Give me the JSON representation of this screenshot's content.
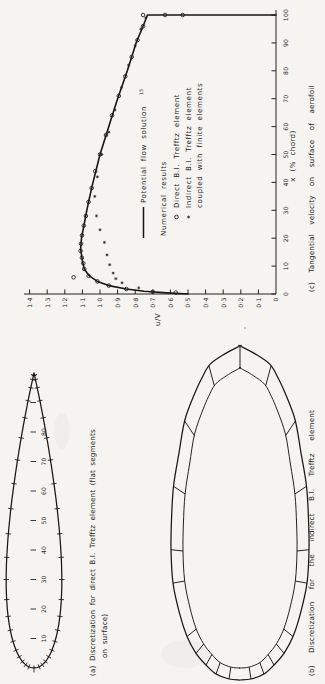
{
  "figure": {
    "background": "#f5f4f0",
    "ink": "#222222",
    "orientation": "rotated-90-ccw"
  },
  "panel_a": {
    "caption_line1": "(a) Discretization for direct B.I. Trefftz element (flat segments",
    "caption_line2": "on surface)",
    "scale_labels": [
      "10",
      "20",
      "30",
      "40",
      "50",
      "60",
      "70",
      "80"
    ]
  },
  "panel_b": {
    "caption": "(b) Discretization for the indirect B.I. Trefftz element"
  },
  "panel_c": {
    "caption": "(c) Tangential velocity on surface of aerofoil",
    "legend": {
      "line_label": "Potential flow solution",
      "line_label_ref": "15",
      "group_label": "Numerical results",
      "circle_label": "Direct B.I. Trefftz element",
      "star_label_line1": "Indirect B.I. Trefftz element",
      "star_label_line2": "coupled with finite elements"
    }
  },
  "chart_data": {
    "type": "line",
    "title": "(c) Tangential velocity on surface of aerofoil",
    "xlabel": "x (% chord)",
    "ylabel": "u/V",
    "xlim": [
      0,
      100
    ],
    "ylim": [
      0,
      1.4
    ],
    "grid": false,
    "legend_position": "inside-below-curve",
    "x_tick_values": [
      0,
      10,
      20,
      30,
      40,
      50,
      60,
      70,
      80,
      90,
      100
    ],
    "x_tick_labels": [
      "0",
      "10",
      "20",
      "30",
      "40",
      "50",
      "60",
      "70",
      "80",
      "90",
      "100"
    ],
    "y_tick_values": [
      0,
      0.1,
      0.2,
      0.3,
      0.4,
      0.5,
      0.6,
      0.7,
      0.8,
      0.9,
      1.0,
      1.1,
      1.2,
      1.3,
      1.4
    ],
    "y_tick_labels": [
      "0",
      "0·1",
      "0·2",
      "0·3",
      "0·4",
      "0·5",
      "0·6",
      "0·7",
      "0·8",
      "0·9",
      "1·0",
      "1·1",
      "1·2",
      "1·3",
      "1·4"
    ],
    "series": [
      {
        "name": "Potential flow solution",
        "type": "line",
        "points": [
          [
            0,
            0.5
          ],
          [
            0.4,
            0.62
          ],
          [
            1,
            0.75
          ],
          [
            1.8,
            0.85
          ],
          [
            3,
            0.95
          ],
          [
            4.5,
            1.015
          ],
          [
            6.5,
            1.06
          ],
          [
            9,
            1.09
          ],
          [
            12,
            1.1
          ],
          [
            16,
            1.11
          ],
          [
            20,
            1.105
          ],
          [
            25,
            1.09
          ],
          [
            30,
            1.075
          ],
          [
            35,
            1.058
          ],
          [
            40,
            1.04
          ],
          [
            45,
            1.02
          ],
          [
            50,
            1.0
          ],
          [
            55,
            0.975
          ],
          [
            60,
            0.95
          ],
          [
            65,
            0.925
          ],
          [
            70,
            0.9
          ],
          [
            75,
            0.872
          ],
          [
            80,
            0.845
          ],
          [
            85,
            0.82
          ],
          [
            90,
            0.795
          ],
          [
            95,
            0.762
          ],
          [
            100,
            0.73
          ],
          [
            100,
            0
          ]
        ]
      },
      {
        "name": "Direct B.I. Trefftz element",
        "type": "scatter",
        "marker": "circle",
        "points": [
          [
            0.5,
            0.57
          ],
          [
            0.8,
            0.7
          ],
          [
            1.8,
            0.85
          ],
          [
            3,
            0.95
          ],
          [
            4.5,
            1.015
          ],
          [
            6,
            1.15
          ],
          [
            6.5,
            1.065
          ],
          [
            9,
            1.09
          ],
          [
            11,
            1.095
          ],
          [
            13,
            1.103
          ],
          [
            15.5,
            1.11
          ],
          [
            18,
            1.108
          ],
          [
            21,
            1.102
          ],
          [
            24.5,
            1.092
          ],
          [
            28,
            1.08
          ],
          [
            33,
            1.065
          ],
          [
            38,
            1.047
          ],
          [
            44,
            1.027
          ],
          [
            50,
            1.0
          ],
          [
            57,
            0.966
          ],
          [
            64,
            0.932
          ],
          [
            71,
            0.893
          ],
          [
            78,
            0.856
          ],
          [
            85,
            0.82
          ],
          [
            91,
            0.787
          ],
          [
            96,
            0.755
          ],
          [
            100,
            0.755
          ],
          [
            100,
            0.63
          ],
          [
            100,
            0.53
          ]
        ]
      },
      {
        "name": "Indirect B.I. Trefftz element coupled with finite elements",
        "type": "scatter",
        "marker": "star",
        "points": [
          [
            2.2,
            0.78
          ],
          [
            4,
            0.875
          ],
          [
            5.5,
            0.91
          ],
          [
            7.5,
            0.925
          ],
          [
            10.5,
            0.945
          ],
          [
            14,
            0.96
          ],
          [
            18.5,
            0.975
          ],
          [
            23,
            1.0
          ],
          [
            28,
            1.02
          ],
          [
            35,
            1.03
          ],
          [
            42,
            1.015
          ],
          [
            50,
            0.99
          ],
          [
            58,
            0.95
          ],
          [
            66,
            0.915
          ],
          [
            74,
            0.878
          ],
          [
            82,
            0.838
          ],
          [
            89,
            0.8
          ],
          [
            95,
            0.768
          ],
          [
            99,
            0.74
          ]
        ]
      }
    ]
  }
}
